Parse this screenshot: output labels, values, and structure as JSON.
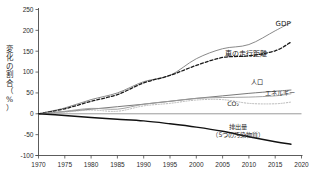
{
  "chart_data": {
    "type": "line",
    "title": "",
    "xlabel": "",
    "ylabel": "変化の割合（%）",
    "ylabel_chars": [
      "変",
      "化",
      "の",
      "割",
      "合",
      "（",
      "%",
      "）"
    ],
    "xlim": [
      1970,
      2020
    ],
    "ylim": [
      -100,
      250
    ],
    "xticks": [
      1970,
      1975,
      1980,
      1985,
      1990,
      1995,
      2000,
      2005,
      2010,
      2015,
      2020
    ],
    "yticks": [
      -100,
      -50,
      0,
      50,
      100,
      150,
      200,
      250
    ],
    "xtick_labels": [
      "1970",
      "1975",
      "1980",
      "1985",
      "1990",
      "1995",
      "2000",
      "2005",
      "2010",
      "2015",
      "2020"
    ],
    "ytick_labels": [
      "-100",
      "-50",
      "0",
      "50",
      "100",
      "150",
      "200",
      "250"
    ],
    "grid": false,
    "legend_position": "inline-right",
    "x": [
      1970,
      1975,
      1980,
      1985,
      1990,
      1995,
      2000,
      2005,
      2010,
      2015,
      2018
    ],
    "series": [
      {
        "name": "GDP",
        "label": "GDP",
        "color": "#8a8a8a",
        "style": "solid",
        "width": 1.0,
        "values": [
          0,
          14,
          34,
          50,
          77,
          92,
          132,
          156,
          166,
          199,
          219
        ],
        "label_x": 2016.5,
        "label_y": 210
      },
      {
        "name": "vehicle-miles-traveled",
        "label": "車の走行距離",
        "color": "#1a1a1a",
        "style": "dashed",
        "width": 1.3,
        "values": [
          0,
          12,
          30,
          46,
          74,
          92,
          116,
          135,
          139,
          151,
          172
        ],
        "label_x": 2009.5,
        "label_y": 139
      },
      {
        "name": "population",
        "label": "人口",
        "color": "#6a6a6a",
        "style": "solid",
        "width": 0.9,
        "values": [
          0,
          5,
          11,
          17,
          23,
          30,
          37,
          43,
          49,
          54,
          57
        ],
        "label_x": 2011.5,
        "label_y": 72
      },
      {
        "name": "energy",
        "label": "エネルギー",
        "color": "#9a9a9a",
        "style": "solid",
        "width": 0.9,
        "values": [
          0,
          6,
          13,
          11,
          23,
          30,
          37,
          39,
          40,
          43,
          48
        ],
        "label_x": 2016.0,
        "label_y": 44
      },
      {
        "name": "co2",
        "label": "CO₂",
        "color": "#b0b0b0",
        "style": "dotted",
        "width": 0.9,
        "values": [
          0,
          4,
          9,
          6,
          19,
          25,
          33,
          34,
          25,
          24,
          28
        ],
        "label_x": 2007.0,
        "label_y": 18
      },
      {
        "name": "emissions-five-pollutants",
        "label": "排出量\n（5つの汚染物質）",
        "label_line1": "排出量",
        "label_line2": "（5つの汚染物質）",
        "color": "#111111",
        "style": "solid",
        "width": 1.4,
        "values": [
          0,
          -4,
          -9,
          -13,
          -17,
          -24,
          -32,
          -42,
          -55,
          -67,
          -73
        ],
        "label_x": 2008.0,
        "label_y": -36
      }
    ]
  }
}
